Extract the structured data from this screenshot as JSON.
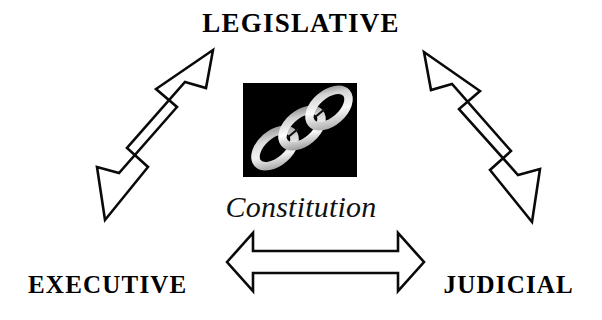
{
  "diagram": {
    "title_implied": "Separation of Powers",
    "background_color": "#ffffff",
    "ink_color": "#000000",
    "nodes": [
      {
        "id": "legislative",
        "label": "LEGISLATIVE",
        "position": "top-center",
        "style": "bold-serif-uppercase"
      },
      {
        "id": "executive",
        "label": "EXECUTIVE",
        "position": "bottom-left",
        "style": "bold-serif-uppercase"
      },
      {
        "id": "judicial",
        "label": "JUDICIAL",
        "position": "bottom-right",
        "style": "bold-serif-uppercase"
      }
    ],
    "center": {
      "caption": "Constitution",
      "caption_style": "italic-serif",
      "emblem": {
        "name": "chain-links-emblem",
        "description": "three interlocking chain links",
        "background_color": "#000000",
        "link_color": "#e8e8e8"
      }
    },
    "connectors": [
      {
        "id": "legislative-executive",
        "type": "double-headed-arrow",
        "orientation": "diagonal-up-right",
        "from": "EXECUTIVE",
        "to": "LEGISLATIVE",
        "fill": "#ffffff",
        "outline": "#000000"
      },
      {
        "id": "legislative-judicial",
        "type": "double-headed-arrow",
        "orientation": "diagonal-down-right",
        "from": "LEGISLATIVE",
        "to": "JUDICIAL",
        "fill": "#ffffff",
        "outline": "#000000"
      },
      {
        "id": "executive-judicial",
        "type": "double-headed-arrow",
        "orientation": "horizontal",
        "from": "EXECUTIVE",
        "to": "JUDICIAL",
        "fill": "#ffffff",
        "outline": "#000000"
      }
    ]
  }
}
